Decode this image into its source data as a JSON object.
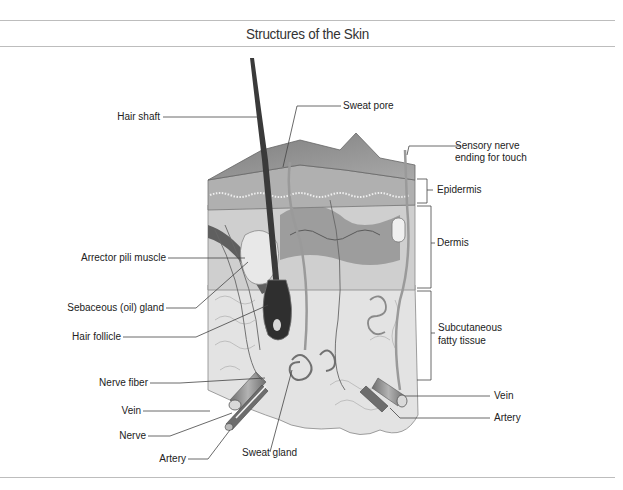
{
  "figure": {
    "title": "Structures of the Skin"
  },
  "labels": {
    "hair_shaft": "Hair shaft",
    "sweat_pore": "Sweat pore",
    "sensory_nerve_line1": "Sensory nerve",
    "sensory_nerve_line2": "ending for touch",
    "epidermis": "Epidermis",
    "dermis": "Dermis",
    "subcutaneous_line1": "Subcutaneous",
    "subcutaneous_line2": "fatty tissue",
    "arrector_pili": "Arrector pili muscle",
    "sebaceous_gland": "Sebaceous (oil) gland",
    "hair_follicle": "Hair follicle",
    "nerve_fiber": "Nerve fiber",
    "vein_left": "Vein",
    "nerve": "Nerve",
    "artery_left": "Artery",
    "sweat_gland": "Sweat gland",
    "vein_right": "Vein",
    "artery_right": "Artery"
  },
  "colors": {
    "rule": "#bdbdbd",
    "leader": "#444444",
    "hair": "#3a3a3a",
    "epidermis_top": "#8f8f8f",
    "dermis": "#c8c8c8",
    "fat": "#e2e2e2"
  }
}
